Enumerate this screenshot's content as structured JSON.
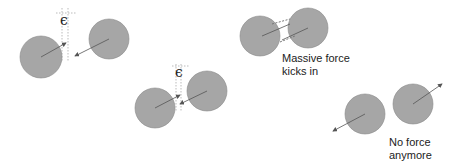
{
  "colors": {
    "ball_fill": "#a6a6a6",
    "ball_stroke": "#8a8a8a",
    "arrow": "#555555",
    "dotted": "#bbbbbb",
    "text": "#222222"
  },
  "panels": [
    {
      "id": "approach",
      "epsilon_label": "ϵ"
    },
    {
      "id": "contact",
      "epsilon_label": "ϵ"
    },
    {
      "id": "overlap",
      "caption_line1": "Massive force",
      "caption_line2": "kicks in"
    },
    {
      "id": "separate",
      "caption_line1": "No force",
      "caption_line2": "anymore"
    }
  ]
}
